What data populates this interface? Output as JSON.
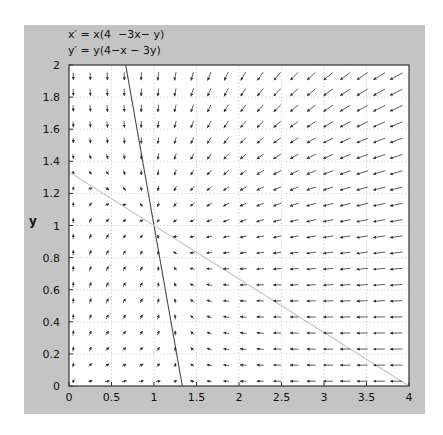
{
  "equations": {
    "x_prime": "x′ = x(4  −3x− y)",
    "y_prime": "y′ = y(4−x − 3y)"
  },
  "axes": {
    "xlabel": "",
    "ylabel": "y",
    "x_ticks": [
      "0",
      "0.5",
      "1",
      "1.5",
      "2",
      "2.5",
      "3",
      "3.5",
      "4"
    ],
    "y_ticks": [
      "0",
      "0.2",
      "0.4",
      "0.6",
      "0.8",
      "1",
      "1.2",
      "1.4",
      "1.6",
      "1.8",
      "2"
    ]
  },
  "colors": {
    "panel": "#c4c4c4",
    "plot_bg": "#ffffff",
    "arrow": "#333333",
    "nullcline_x": "#444444",
    "nullcline_y": "#c8c8c8",
    "grid": "#bbbbbb"
  },
  "chart_data": {
    "type": "direction_field",
    "system": {
      "dx": "x*(4-3*x-y)",
      "dy": "y*(4-x-3*y)"
    },
    "xlabel": "",
    "ylabel": "y",
    "xlim": [
      0,
      4
    ],
    "ylim": [
      0,
      2
    ],
    "x_ticks": [
      0,
      0.5,
      1,
      1.5,
      2,
      2.5,
      3,
      3.5,
      4
    ],
    "y_ticks": [
      0,
      0.2,
      0.4,
      0.6,
      0.8,
      1,
      1.2,
      1.4,
      1.6,
      1.8,
      2
    ],
    "grid": true,
    "arrow_grid": {
      "nx": 20,
      "ny": 20
    },
    "nullclines": [
      {
        "name": "x-nullcline 4-3x-y=0",
        "points": [
          [
            0.667,
            2
          ],
          [
            1.333,
            0
          ]
        ],
        "style": "dark"
      },
      {
        "name": "y-nullcline 4-x-3y=0",
        "points": [
          [
            0,
            1.333
          ],
          [
            4,
            0
          ]
        ],
        "style": "light"
      }
    ],
    "equilibrium": [
      1,
      1
    ]
  }
}
